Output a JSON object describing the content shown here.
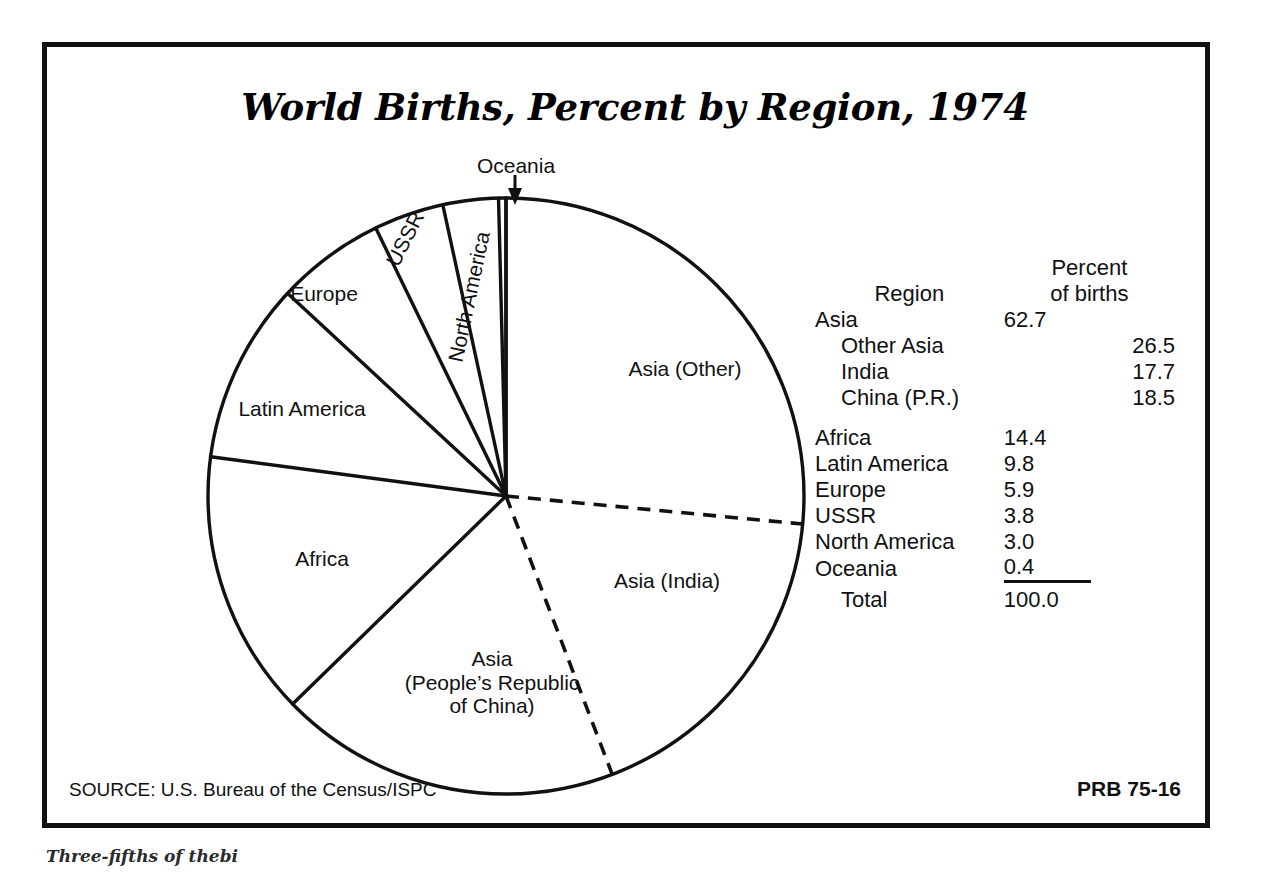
{
  "title": "World Births, Percent by Region, 1974",
  "footer": {
    "source": "SOURCE: U.S. Bureau of the Census/ISPC",
    "code": "PRB 75-16"
  },
  "caption_below": "Three-fifths of thebi",
  "pie_labels": {
    "oceania": "Oceania",
    "north_america": "North America",
    "ussr": "USSR",
    "europe": "Europe",
    "latin_america": "Latin America",
    "africa": "Africa",
    "china_l1": "Asia",
    "china_l2": "(People’s Republic",
    "china_l3": "of China)",
    "asia_other": "Asia (Other)",
    "asia_india": "Asia (India)"
  },
  "legend": {
    "header_region": "Region",
    "header_percent_l1": "Percent",
    "header_percent_l2": "of births",
    "rows": [
      {
        "label": "Asia",
        "main": "62.7",
        "sub": "",
        "indent": false
      },
      {
        "label": "Other Asia",
        "main": "",
        "sub": "26.5",
        "indent": true
      },
      {
        "label": "India",
        "main": "",
        "sub": "17.7",
        "indent": true
      },
      {
        "label": "China (P.R.)",
        "main": "",
        "sub": "18.5",
        "indent": true
      },
      {
        "label": "Africa",
        "main": "14.4",
        "sub": "",
        "indent": false
      },
      {
        "label": "Latin America",
        "main": "9.8",
        "sub": "",
        "indent": false
      },
      {
        "label": "Europe",
        "main": "5.9",
        "sub": "",
        "indent": false
      },
      {
        "label": "USSR",
        "main": "3.8",
        "sub": "",
        "indent": false
      },
      {
        "label": "North America",
        "main": "3.0",
        "sub": "",
        "indent": false
      },
      {
        "label": "Oceania",
        "main": "0.4",
        "sub": "",
        "indent": false
      }
    ],
    "total_label": "Total",
    "total_value": "100.0"
  },
  "chart_data": {
    "type": "pie",
    "title": "World Births, Percent by Region, 1974",
    "units": "percent of births",
    "start_angle_deg": 0,
    "direction": "clockwise",
    "total": 100.0,
    "categories": [
      "Asia (Other)",
      "Asia (India)",
      "Asia (People's Republic of China)",
      "Africa",
      "Latin America",
      "Europe",
      "USSR",
      "North America",
      "Oceania"
    ],
    "values": [
      26.5,
      17.7,
      18.5,
      14.4,
      9.8,
      5.9,
      3.8,
      3.0,
      0.4
    ],
    "groups": [
      {
        "name": "Asia",
        "value": 62.7,
        "members": [
          "Asia (Other)",
          "Asia (India)",
          "Asia (People's Republic of China)"
        ]
      }
    ],
    "slice_boundary_styles": {
      "Asia (Other)|Asia (India)": "dashed",
      "Asia (India)|Asia (People's Republic of China)": "dashed",
      "default": "solid"
    },
    "annotations": [
      {
        "text": "Oceania",
        "target": "Oceania",
        "type": "arrow-callout"
      }
    ],
    "legend_position": "right",
    "grid": false
  },
  "geometry": {
    "cx": 501,
    "cy": 491,
    "r": 298
  }
}
